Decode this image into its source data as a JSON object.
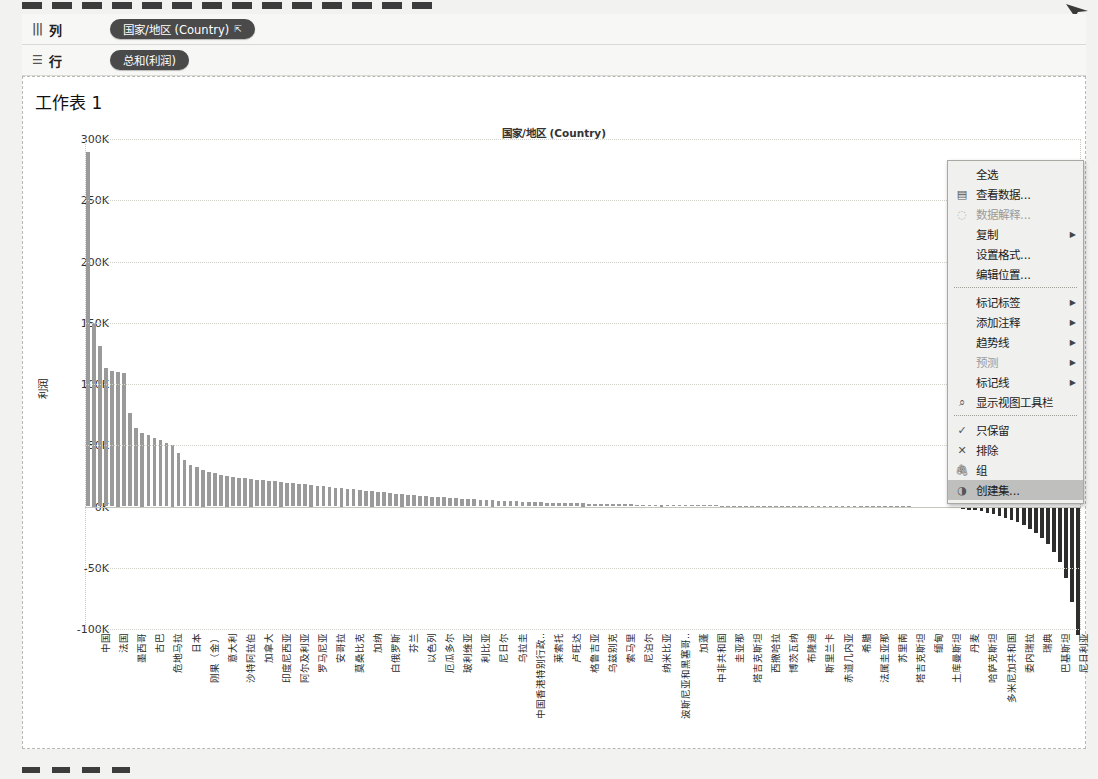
{
  "window": {
    "dash_count": 14
  },
  "shelves": [
    {
      "name": "columns",
      "label": "列",
      "icon": "columns-icon",
      "pill": "国家/地区 (Country)",
      "sort_glyph": "⇱"
    },
    {
      "name": "rows",
      "label": "行",
      "icon": "rows-icon",
      "pill": "总和(利润)",
      "sort_glyph": ""
    }
  ],
  "sheet": {
    "title": "工作表 1",
    "column_header": "国家/地区 (Country)"
  },
  "context_menu": {
    "items": [
      {
        "label": "全选",
        "icon": "",
        "submenu": false,
        "disabled": false,
        "selected": false
      },
      {
        "label": "查看数据...",
        "icon": "grid-icon",
        "submenu": false,
        "disabled": false,
        "selected": false
      },
      {
        "label": "数据解释...",
        "icon": "lightbulb-icon",
        "submenu": false,
        "disabled": true,
        "selected": false
      },
      {
        "label": "复制",
        "icon": "",
        "submenu": true,
        "disabled": false,
        "selected": false
      },
      {
        "label": "设置格式...",
        "icon": "",
        "submenu": false,
        "disabled": false,
        "selected": false
      },
      {
        "label": "编辑位置...",
        "icon": "",
        "submenu": false,
        "disabled": false,
        "selected": false
      },
      {
        "separator": true
      },
      {
        "label": "标记标签",
        "icon": "",
        "submenu": true,
        "disabled": false,
        "selected": false
      },
      {
        "label": "添加注释",
        "icon": "",
        "submenu": true,
        "disabled": false,
        "selected": false
      },
      {
        "label": "趋势线",
        "icon": "",
        "submenu": true,
        "disabled": false,
        "selected": false
      },
      {
        "label": "预测",
        "icon": "",
        "submenu": true,
        "disabled": true,
        "selected": false
      },
      {
        "label": "标记线",
        "icon": "",
        "submenu": true,
        "disabled": false,
        "selected": false
      },
      {
        "label": "显示视图工具栏",
        "icon": "magnifier-icon",
        "submenu": false,
        "disabled": false,
        "selected": false
      },
      {
        "separator": true
      },
      {
        "label": "只保留",
        "icon": "check-icon",
        "submenu": false,
        "disabled": false,
        "selected": false
      },
      {
        "label": "排除",
        "icon": "cross-icon",
        "submenu": false,
        "disabled": false,
        "selected": false
      },
      {
        "label": "组",
        "icon": "paperclip-icon",
        "submenu": false,
        "disabled": false,
        "selected": false
      },
      {
        "label": "创建集...",
        "icon": "set-icon",
        "submenu": false,
        "disabled": false,
        "selected": true
      }
    ]
  },
  "chart_data": {
    "type": "bar",
    "title": "工作表 1",
    "xlabel": "国家/地区 (Country)",
    "ylabel": "利润",
    "ylim": [
      -100000,
      300000
    ],
    "yticks": [
      300000,
      250000,
      200000,
      150000,
      100000,
      50000,
      0,
      -50000,
      -100000
    ],
    "ytick_labels": [
      "300K",
      "250K",
      "200K",
      "150K",
      "100K",
      "50K",
      "0K",
      "-50K",
      "-100K"
    ],
    "grid": true,
    "legend": "none",
    "positive_color": "#9a9a9a",
    "negative_color": "#2e2e2e",
    "labeled_categories": [
      "中国",
      "法国",
      "墨西哥",
      "古巴",
      "危地马拉",
      "日本",
      "刚果（金）",
      "意大利",
      "沙特阿拉伯",
      "加拿大",
      "印度尼西亚",
      "阿尔及利亚",
      "罗马尼亚",
      "安哥拉",
      "莫桑比克",
      "加纳",
      "白俄罗斯",
      "芬兰",
      "以色列",
      "厄瓜多尔",
      "玻利维亚",
      "利比亚",
      "尼日尔",
      "乌拉圭",
      "中国香港特别行政..",
      "莱索托",
      "卢旺达",
      "格鲁吉亚",
      "乌兹别克",
      "索马里",
      "尼泊尔",
      "纳米比亚",
      "波斯尼亚和黑塞哥..",
      "加蓬",
      "中非共和国",
      "圭亚那",
      "塔吉克斯坦",
      "西撒哈拉",
      "博茨瓦纳",
      "布隆迪",
      "斯里兰卡",
      "赤道几内亚",
      "希腊",
      "法属圭亚那",
      "苏里南",
      "塔吉克斯坦",
      "缅甸",
      "土库曼斯坦",
      "丹麦",
      "哈萨克斯坦",
      "多米尼加共和国",
      "委内瑞拉",
      "瑞典",
      "巴基斯坦",
      "尼日利亚"
    ],
    "values": [
      289000,
      150000,
      131000,
      113000,
      111000,
      110000,
      109000,
      76000,
      64000,
      60000,
      58000,
      56000,
      54000,
      52000,
      50000,
      44000,
      38000,
      34000,
      32000,
      30000,
      28000,
      27000,
      26000,
      25000,
      24000,
      23500,
      23000,
      22500,
      22000,
      21500,
      21000,
      20500,
      20000,
      19500,
      19000,
      18500,
      18000,
      17500,
      17000,
      16500,
      16000,
      15500,
      15000,
      14500,
      14000,
      13500,
      13000,
      12500,
      12000,
      11500,
      11000,
      10500,
      10000,
      9600,
      9200,
      8800,
      8400,
      8000,
      7700,
      7400,
      7100,
      6800,
      6500,
      6200,
      5900,
      5600,
      5300,
      5000,
      4800,
      4600,
      4400,
      4200,
      4000,
      3800,
      3600,
      3400,
      3200,
      3000,
      2900,
      2800,
      2700,
      2600,
      2500,
      2400,
      2300,
      2200,
      2100,
      2000,
      1900,
      1800,
      1700,
      1600,
      1500,
      1400,
      1300,
      1250,
      1200,
      1150,
      1100,
      1050,
      1000,
      960,
      920,
      880,
      840,
      800,
      770,
      740,
      710,
      680,
      650,
      620,
      590,
      560,
      530,
      500,
      470,
      440,
      410,
      380,
      350,
      320,
      300,
      280,
      260,
      240,
      220,
      200,
      180,
      160,
      140,
      120,
      100,
      80,
      60,
      40,
      20,
      -60,
      -120,
      -200,
      -320,
      -480,
      -700,
      -1000,
      -1400,
      -1900,
      -2500,
      -3200,
      -4000,
      -5000,
      -6200,
      -7600,
      -9200,
      -11000,
      -13000,
      -15500,
      -18500,
      -22000,
      -26000,
      -31000,
      -37000,
      -45000,
      -58000,
      -78000,
      -105000
    ]
  }
}
